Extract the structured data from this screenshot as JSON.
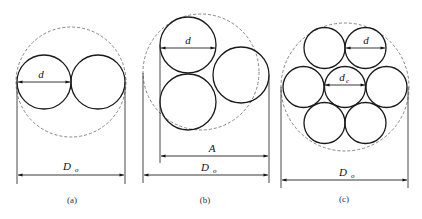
{
  "diagram": {
    "panels": [
      {
        "id": "a",
        "caption": "(a)",
        "labels": {
          "d": "d",
          "D": "D",
          "D_sub": "o"
        }
      },
      {
        "id": "b",
        "caption": "(b)",
        "labels": {
          "d": "d",
          "A": "A",
          "D": "D",
          "D_sub": "o"
        }
      },
      {
        "id": "c",
        "caption": "(c)",
        "labels": {
          "d": "d",
          "dc": "d",
          "dc_sub": "c",
          "D": "D",
          "D_sub": "o"
        }
      }
    ]
  }
}
